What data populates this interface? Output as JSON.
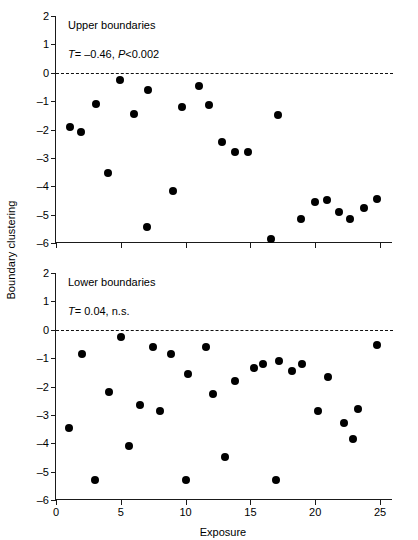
{
  "figure": {
    "ylabel": "Boundary clustering",
    "xlabel": "Exposure"
  },
  "chart_data": [
    {
      "type": "scatter",
      "panel": "upper",
      "title": "Upper boundaries",
      "stat_symbol": "T",
      "stat_text": "T = –0.46, P<0.002",
      "stat_tau_label": "T",
      "stat_tau_value": "= –0.46,",
      "stat_p_label": "P",
      "stat_p_value": "<0.002",
      "xlabel": "Exposure",
      "ylabel": "Boundary clustering",
      "xlim": [
        0,
        26
      ],
      "ylim": [
        -6,
        2
      ],
      "xticks": [
        0,
        5,
        10,
        15,
        20,
        25
      ],
      "yticks": [
        2,
        1,
        0,
        -1,
        -2,
        -3,
        -4,
        -5,
        -6
      ],
      "grid": false,
      "legend": "none",
      "zero_reference_line": 0,
      "marker_color": "#000000",
      "points": [
        {
          "x": 1.1,
          "y": -1.9
        },
        {
          "x": 1.9,
          "y": -2.1
        },
        {
          "x": 3.1,
          "y": -1.1
        },
        {
          "x": 4.0,
          "y": -3.55
        },
        {
          "x": 4.9,
          "y": -0.25
        },
        {
          "x": 6.0,
          "y": -1.45
        },
        {
          "x": 7.0,
          "y": -5.45
        },
        {
          "x": 7.1,
          "y": -0.6
        },
        {
          "x": 9.0,
          "y": -4.15
        },
        {
          "x": 9.7,
          "y": -1.2
        },
        {
          "x": 11.0,
          "y": -0.45
        },
        {
          "x": 11.8,
          "y": -1.15
        },
        {
          "x": 12.8,
          "y": -2.45
        },
        {
          "x": 13.8,
          "y": -2.8
        },
        {
          "x": 14.8,
          "y": -2.8
        },
        {
          "x": 16.6,
          "y": -5.85
        },
        {
          "x": 17.1,
          "y": -1.5
        },
        {
          "x": 18.9,
          "y": -5.15
        },
        {
          "x": 20.0,
          "y": -4.55
        },
        {
          "x": 20.9,
          "y": -4.5
        },
        {
          "x": 21.8,
          "y": -4.9
        },
        {
          "x": 22.7,
          "y": -5.15
        },
        {
          "x": 23.8,
          "y": -4.75
        },
        {
          "x": 24.8,
          "y": -4.45
        }
      ]
    },
    {
      "type": "scatter",
      "panel": "lower",
      "title": "Lower boundaries",
      "stat_symbol": "T",
      "stat_text": "T = 0.04, n.s.",
      "stat_tau_label": "T",
      "stat_tau_value": "= 0.04, n.s.",
      "stat_p_label": "",
      "stat_p_value": "",
      "xlabel": "Exposure",
      "ylabel": "Boundary clustering",
      "xlim": [
        0,
        26
      ],
      "ylim": [
        -6,
        2
      ],
      "xticks": [
        0,
        5,
        10,
        15,
        20,
        25
      ],
      "yticks": [
        2,
        1,
        0,
        -1,
        -2,
        -3,
        -4,
        -5,
        -6
      ],
      "grid": false,
      "legend": "none",
      "zero_reference_line": 0,
      "marker_color": "#000000",
      "points": [
        {
          "x": 1.0,
          "y": -3.45
        },
        {
          "x": 2.0,
          "y": -0.85
        },
        {
          "x": 3.0,
          "y": -5.3
        },
        {
          "x": 4.1,
          "y": -2.2
        },
        {
          "x": 5.0,
          "y": -0.25
        },
        {
          "x": 5.6,
          "y": -4.1
        },
        {
          "x": 6.5,
          "y": -2.65
        },
        {
          "x": 7.5,
          "y": -0.6
        },
        {
          "x": 8.0,
          "y": -2.85
        },
        {
          "x": 8.9,
          "y": -0.85
        },
        {
          "x": 10.0,
          "y": -5.3
        },
        {
          "x": 10.2,
          "y": -1.55
        },
        {
          "x": 11.6,
          "y": -0.6
        },
        {
          "x": 12.1,
          "y": -2.25
        },
        {
          "x": 13.0,
          "y": -4.5
        },
        {
          "x": 13.8,
          "y": -1.8
        },
        {
          "x": 15.3,
          "y": -1.35
        },
        {
          "x": 16.0,
          "y": -1.2
        },
        {
          "x": 17.0,
          "y": -5.3
        },
        {
          "x": 17.2,
          "y": -1.1
        },
        {
          "x": 18.2,
          "y": -1.45
        },
        {
          "x": 19.0,
          "y": -1.2
        },
        {
          "x": 20.2,
          "y": -2.85
        },
        {
          "x": 21.0,
          "y": -1.65
        },
        {
          "x": 22.2,
          "y": -3.3
        },
        {
          "x": 22.9,
          "y": -3.85
        },
        {
          "x": 23.3,
          "y": -2.8
        },
        {
          "x": 24.8,
          "y": -0.55
        }
      ]
    }
  ]
}
